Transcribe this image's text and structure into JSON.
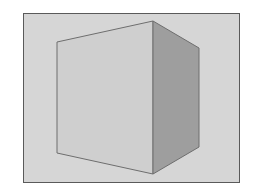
{
  "figure": {
    "colors": {
      "background": "#ffffff",
      "frame_border": "#5a5a5a",
      "frame_fill": "#d6d6d6",
      "front_face": "#cfcfcf",
      "side_face": "#9e9e9e",
      "edge": "#6e6e6e"
    }
  }
}
